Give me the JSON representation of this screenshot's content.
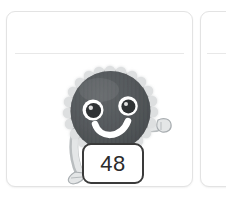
{
  "canvas": {
    "width": 226,
    "height": 201,
    "background": "#ffffff"
  },
  "cards": [
    {
      "name": "main-card",
      "divider": true,
      "border_color": "#e3e3e3",
      "background": "#ffffff"
    },
    {
      "name": "next-card",
      "divider": true,
      "border_color": "#e3e3e3",
      "background": "#ffffff"
    }
  ],
  "character": {
    "name": "bottle-cap-character",
    "body_color": "#55595c",
    "body_shade_color": "#46494c",
    "outline_color": "#d7d9da",
    "eye_color": "#2f3234",
    "eye_ring_color": "#ffffff",
    "mouth_color": "#ffffff",
    "limb_color": "#d6d8d9",
    "limb_outline_color": "#9aa0a4",
    "expression": "smiling",
    "pose": "one-arm-raised"
  },
  "number_badge": {
    "value": "48",
    "border_color": "#3a3a3a",
    "text_color": "#2b2b2b",
    "background": "#ffffff"
  }
}
